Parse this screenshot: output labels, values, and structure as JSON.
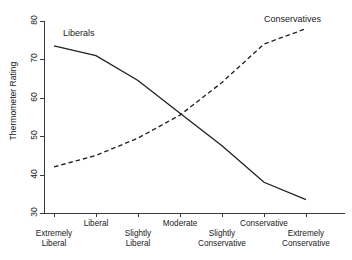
{
  "chart_data": {
    "type": "line",
    "title": "",
    "xlabel": "",
    "ylabel": "Thermometer Rating",
    "categories": [
      "Extremely Liberal",
      "Liberal",
      "Slightly Liberal",
      "Moderate",
      "Slightly Conservative",
      "Conservative",
      "Extremely Conservative"
    ],
    "category_lines": [
      [
        "Extremely",
        "Liberal"
      ],
      [
        "Liberal",
        ""
      ],
      [
        "Slightly",
        "Liberal"
      ],
      [
        "Moderate",
        ""
      ],
      [
        "Slightly",
        "Conservative"
      ],
      [
        "Conservative",
        ""
      ],
      [
        "Extremely",
        "Conservative"
      ]
    ],
    "ylim": [
      30,
      80
    ],
    "yticks": [
      30,
      40,
      50,
      60,
      70,
      80
    ],
    "grid": false,
    "legend_position": "inline-annotations",
    "series": [
      {
        "name": "Liberals",
        "style": "solid",
        "color": "#222222",
        "values": [
          73.5,
          71.0,
          64.5,
          56.0,
          47.5,
          38.0,
          33.5
        ]
      },
      {
        "name": "Conservatives",
        "style": "dashed",
        "color": "#222222",
        "values": [
          42.0,
          45.0,
          49.5,
          55.5,
          64.0,
          74.0,
          78.0
        ]
      }
    ],
    "annotations": [
      {
        "text": "Liberals",
        "near_series": "Liberals"
      },
      {
        "text": "Conservatives",
        "near_series": "Conservatives"
      }
    ]
  }
}
